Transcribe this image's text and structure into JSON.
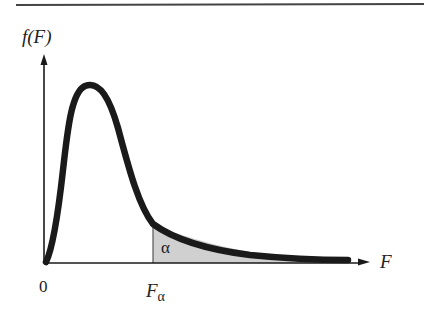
{
  "diagram": {
    "type": "F-distribution density curve with shaded right tail",
    "y_axis_label": "f(F)",
    "x_axis_label": "F",
    "origin_label": "0",
    "critical_value_label_main": "F",
    "critical_value_label_sub": "α",
    "shaded_area_label": "α",
    "colors": {
      "curve": "#1a1a1a",
      "axes": "#1a1a1a",
      "shaded_region": "#d0d0d0",
      "top_rule": "#444444"
    }
  }
}
